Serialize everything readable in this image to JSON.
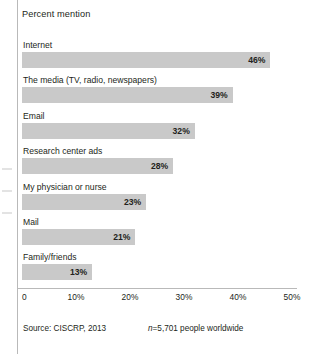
{
  "chart_data": {
    "type": "bar",
    "orientation": "horizontal",
    "title": "Percent mention",
    "xlabel": "",
    "ylabel": "",
    "grid": false,
    "legend": null,
    "xlim": [
      0,
      50
    ],
    "categories": [
      "Internet",
      "The media (TV, radio, newspapers)",
      "Email",
      "Research center ads",
      "My physician or nurse",
      "Mail",
      "Family/friends"
    ],
    "values": [
      46,
      39,
      32,
      28,
      23,
      21,
      13
    ],
    "value_labels": [
      "46%",
      "39%",
      "32%",
      "28%",
      "23%",
      "21%",
      "13%"
    ],
    "tick_values": [
      0,
      10,
      20,
      30,
      40,
      50
    ],
    "tick_labels": [
      "0",
      "10%",
      "20%",
      "30%",
      "40%",
      "50%"
    ],
    "bar_color": "#c9c9c9",
    "text_color": "#231f20"
  },
  "footer": {
    "source": "Source: CISCRP, 2013",
    "sample_prefix": "n",
    "sample_rest": "=5,701 people worldwide"
  }
}
